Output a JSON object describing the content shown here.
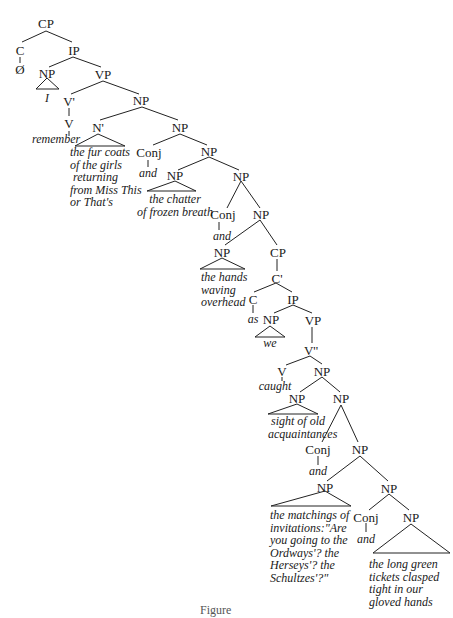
{
  "diagram": {
    "type": "syntax-tree",
    "nodes": {
      "cp_root": "CP",
      "c_root": "C",
      "null_comp": "Ø",
      "ip_root": "IP",
      "np_subject": "NP",
      "subject_word": "I",
      "vp_main": "VP",
      "vbar_main": "V'",
      "v_main": "V",
      "verb_main": "remember",
      "np_object": "NP",
      "nbar": "N'",
      "np_coord1": "NP",
      "conj1": "Conj",
      "and1": "and",
      "np_coord2": "NP",
      "np_chatter": "NP",
      "np_coord3": "NP",
      "conj2": "Conj",
      "and2": "and",
      "np_coord4": "NP",
      "np_hands": "NP",
      "cp_adjunct": "CP",
      "cbar": "C'",
      "c_adjunct": "C",
      "as_word": "as",
      "ip_adjunct": "IP",
      "np_we": "NP",
      "we_word": "we",
      "vp_adjunct": "VP",
      "vbar_adjunct": "V''",
      "v_adjunct": "V",
      "caught_word": "caught",
      "np_obj2": "NP",
      "np_sight": "NP",
      "np_coord5": "NP",
      "conj3": "Conj",
      "and3": "and",
      "np_coord6": "NP",
      "np_matchings": "NP",
      "np_coord7": "NP",
      "conj4": "Conj",
      "and4": "and",
      "np_tickets": "NP"
    },
    "phrases": {
      "fur_coats": [
        "the fur coats",
        "of the girls",
        "returning",
        "from Miss This",
        "or That's"
      ],
      "chatter": [
        "the chatter",
        "of frozen breath"
      ],
      "hands": [
        "the hands",
        "waving",
        "overhead"
      ],
      "sight": [
        "sight of old",
        "acquaintances"
      ],
      "matchings": [
        "the matchings of",
        "invitations:\"Are",
        "you going to the",
        "Ordways'? the",
        "Herseys'? the",
        "Schultzes'?\""
      ],
      "tickets": [
        "the long green",
        "tickets clasped",
        "tight in our",
        "gloved hands"
      ]
    },
    "caption": "Figure"
  }
}
